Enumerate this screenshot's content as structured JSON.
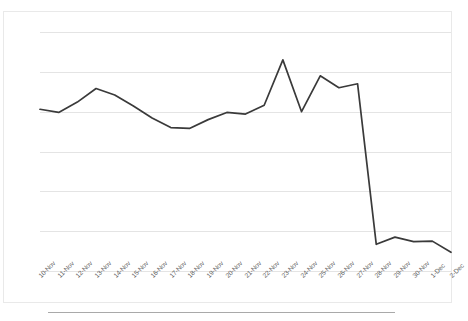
{
  "chart_data": {
    "type": "line",
    "title": "",
    "subtitle": "",
    "xlabel": "",
    "ylabel": "",
    "categories": [
      "10-Nov",
      "11-Nov",
      "12-Nov",
      "13-Nov",
      "14-Nov",
      "15-Nov",
      "16-Nov",
      "17-Nov",
      "18-Nov",
      "19-Nov",
      "20-Nov",
      "21-Nov",
      "22-Nov",
      "23-Nov",
      "24-Nov",
      "25-Nov",
      "26-Nov",
      "27-Nov",
      "28-Nov",
      "29-Nov",
      "30-Nov",
      "1-Dec",
      "2-Dec"
    ],
    "values": [
      0.000203,
      0.000199,
      0.000212,
      0.000229,
      0.000221,
      0.000207,
      0.000192,
      0.00018,
      0.000179,
      0.00019,
      0.000199,
      0.000197,
      0.000208,
      0.000265,
      0.0002,
      0.000245,
      0.00023,
      0.000235,
      3.35e-05,
      4.25e-05,
      3.68e-05,
      3.75e-05,
      2.35e-05
    ],
    "series": [
      {
        "name": "series-1",
        "color": "#3a3a3a",
        "values": [
          0.000203,
          0.000199,
          0.000212,
          0.000229,
          0.000221,
          0.000207,
          0.000192,
          0.00018,
          0.000179,
          0.00019,
          0.000199,
          0.000197,
          0.000208,
          0.000265,
          0.0002,
          0.000245,
          0.00023,
          0.000235,
          3.35e-05,
          4.25e-05,
          3.68e-05,
          3.75e-05,
          2.35e-05
        ]
      }
    ],
    "ytick_labels": [
      "0.0003",
      "0.00025",
      "0.0002",
      "0.00015",
      "0.0001",
      "0.00005",
      "0"
    ],
    "ytick_values": [
      0.0003,
      0.00025,
      0.0002,
      0.00015,
      0.0001,
      5e-05,
      0
    ],
    "ylim": [
      0,
      0.0003
    ],
    "grid": true,
    "grid_axis": "y",
    "legend": false,
    "legend_position": "none",
    "line_color": "#3a3a3a",
    "grid_color": "#e4e4e4",
    "background_color": "#ffffff",
    "markers": false,
    "annotations": []
  }
}
